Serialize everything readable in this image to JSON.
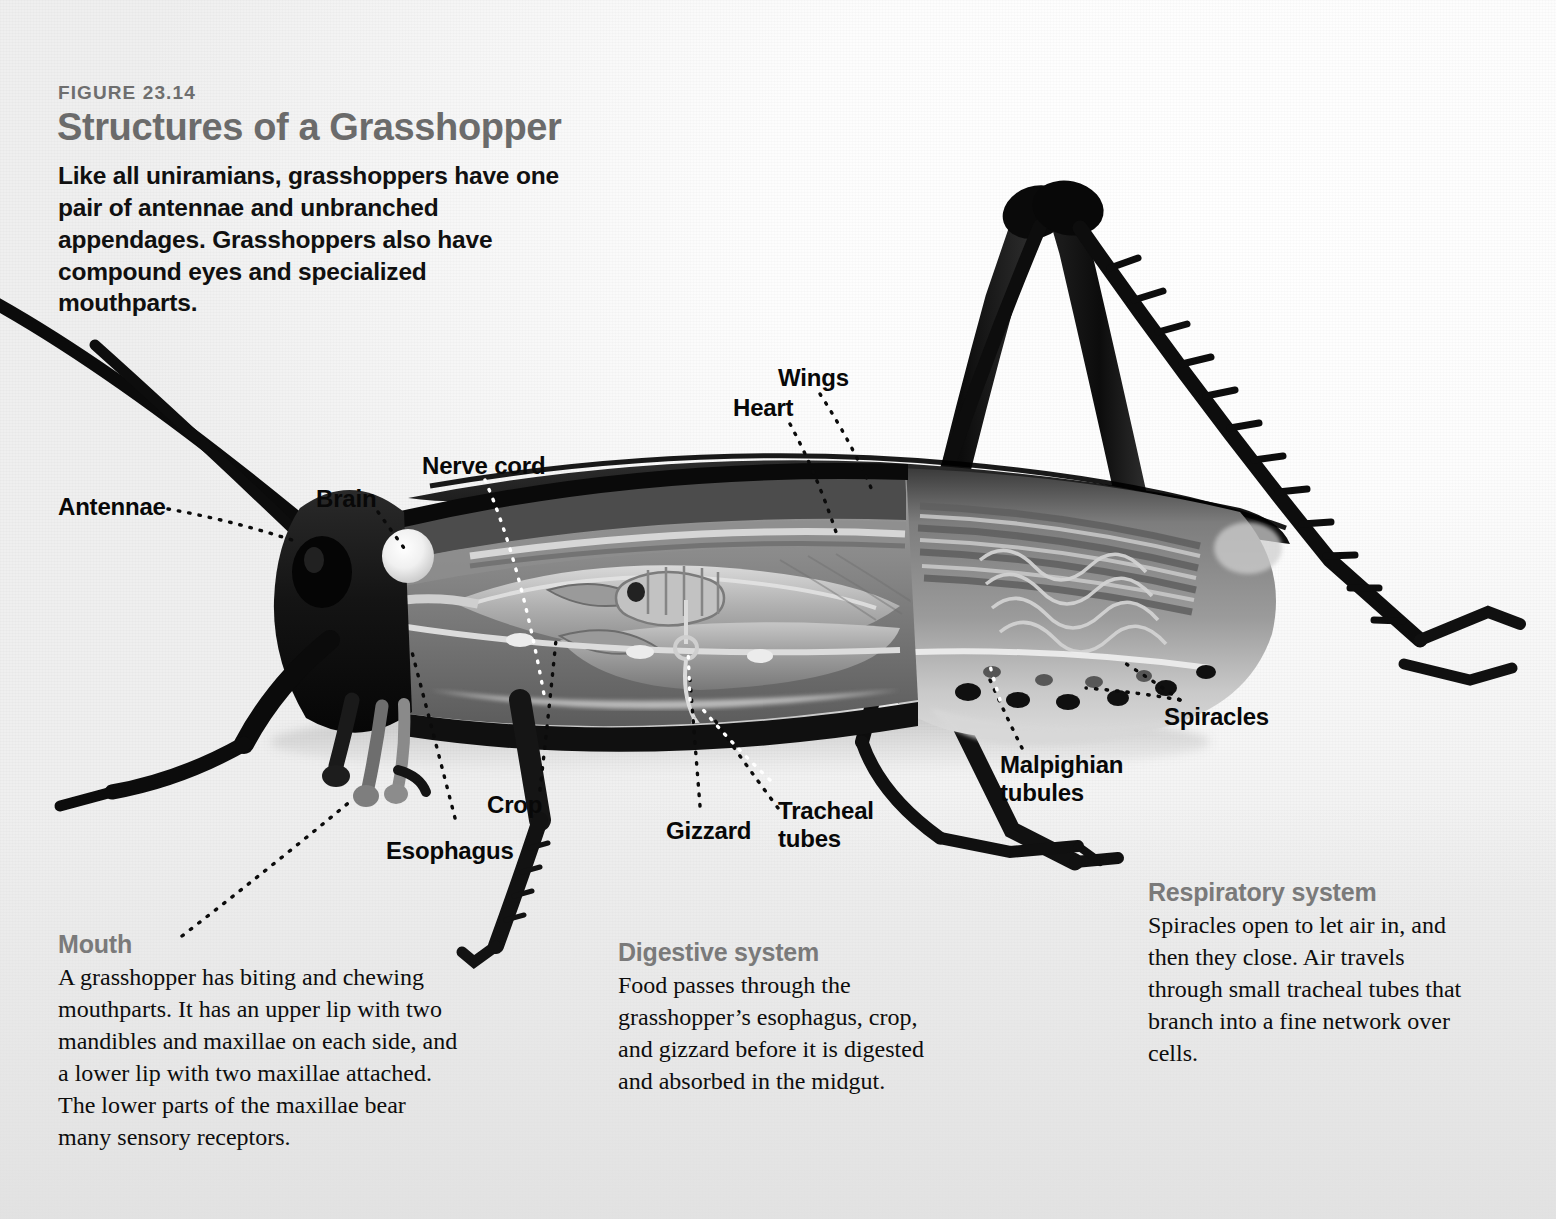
{
  "figure": {
    "number": "FIGURE 23.14",
    "title": "Structures of a Grasshopper",
    "intro": "Like all uniramians, grasshoppers have one pair of antennae and unbranched appendages. Grasshoppers also have compound eyes and specialized mouthparts.",
    "title_color": "#6b6b6b",
    "caption_heading_color": "#7a7a7a",
    "body_color": "#0d0d0d"
  },
  "labels": {
    "antennae": "Antennae",
    "brain": "Brain",
    "nerve_cord": "Nerve cord",
    "heart": "Heart",
    "wings": "Wings",
    "crop": "Crop",
    "esophagus": "Esophagus",
    "gizzard": "Gizzard",
    "tracheal_tubes_l1": "Tracheal",
    "tracheal_tubes_l2": "tubes",
    "malpighian_l1": "Malpighian",
    "malpighian_l2": "tubules",
    "spiracles": "Spiracles",
    "mouth": "Mouth"
  },
  "captions": [
    {
      "id": "mouth",
      "heading": "Mouth",
      "body": "A grasshopper has biting and chewing mouthparts. It has an upper lip with two mandibles and maxillae on each side, and a lower lip with two maxillae attached. The lower parts of the maxillae bear many sensory receptors."
    },
    {
      "id": "digestive",
      "heading": "Digestive system",
      "body": "Food passes through the grasshopper’s esophagus, crop, and gizzard before it is digested and absorbed in the midgut."
    },
    {
      "id": "respiratory",
      "heading": "Respiratory system",
      "body": "Spiracles open to let air in, and then they close. Air travels through small tracheal tubes that branch into a fine network over cells."
    }
  ],
  "illustration": {
    "subject": "grasshopper-cutaway",
    "view": "lateral cutaway, facing left",
    "rendering": "grayscale halftone airbrush illustration",
    "organs_shown": [
      "antennae",
      "brain",
      "nerve cord",
      "esophagus",
      "crop",
      "gizzard",
      "heart",
      "wings",
      "tracheal tubes",
      "Malpighian tubules",
      "spiracles",
      "midgut",
      "compound eye",
      "mouthparts",
      "hind legs",
      "tarsi"
    ]
  }
}
